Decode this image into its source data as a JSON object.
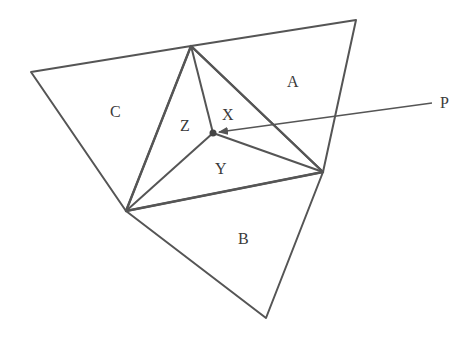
{
  "diagram": {
    "type": "triangulation",
    "stroke_color": "#555555",
    "labels": {
      "A": "A",
      "B": "B",
      "C": "C",
      "X": "X",
      "Y": "Y",
      "Z": "Z",
      "P": "P"
    },
    "vertices": {
      "top": [
        191,
        46
      ],
      "top_right": [
        356,
        20
      ],
      "right": [
        323,
        172
      ],
      "bottom_left": [
        126,
        211
      ],
      "bottom": [
        266,
        318
      ],
      "left": [
        31,
        72
      ],
      "point_P": [
        213,
        133
      ]
    },
    "regions": [
      {
        "name": "A",
        "description": "triangle top-right-topright"
      },
      {
        "name": "B",
        "description": "triangle bottomleft-right-bottom"
      },
      {
        "name": "C",
        "description": "triangle left-top-bottomleft"
      },
      {
        "name": "X",
        "description": "sub-triangle P-top-right"
      },
      {
        "name": "Y",
        "description": "sub-triangle P-right-bottomleft"
      },
      {
        "name": "Z",
        "description": "sub-triangle P-top-bottomleft"
      }
    ],
    "arrow": {
      "from": [
        432,
        103
      ],
      "to": [
        217,
        132
      ],
      "label": "P"
    }
  }
}
